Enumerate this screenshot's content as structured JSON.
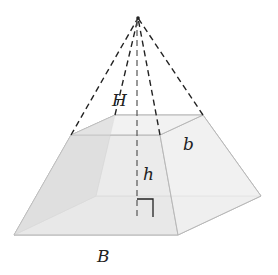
{
  "diagram": {
    "labels": {
      "apex_height": "H",
      "frustum_height": "h",
      "top_base": "b",
      "bottom_base": "B"
    },
    "colors": {
      "face_fill_light": "#efefef",
      "face_fill_mid": "#e6e6e6",
      "face_fill_dark": "#dcdcdc",
      "edge": "#b0b0b0",
      "dashed": "#222222",
      "label": "#222222"
    }
  }
}
